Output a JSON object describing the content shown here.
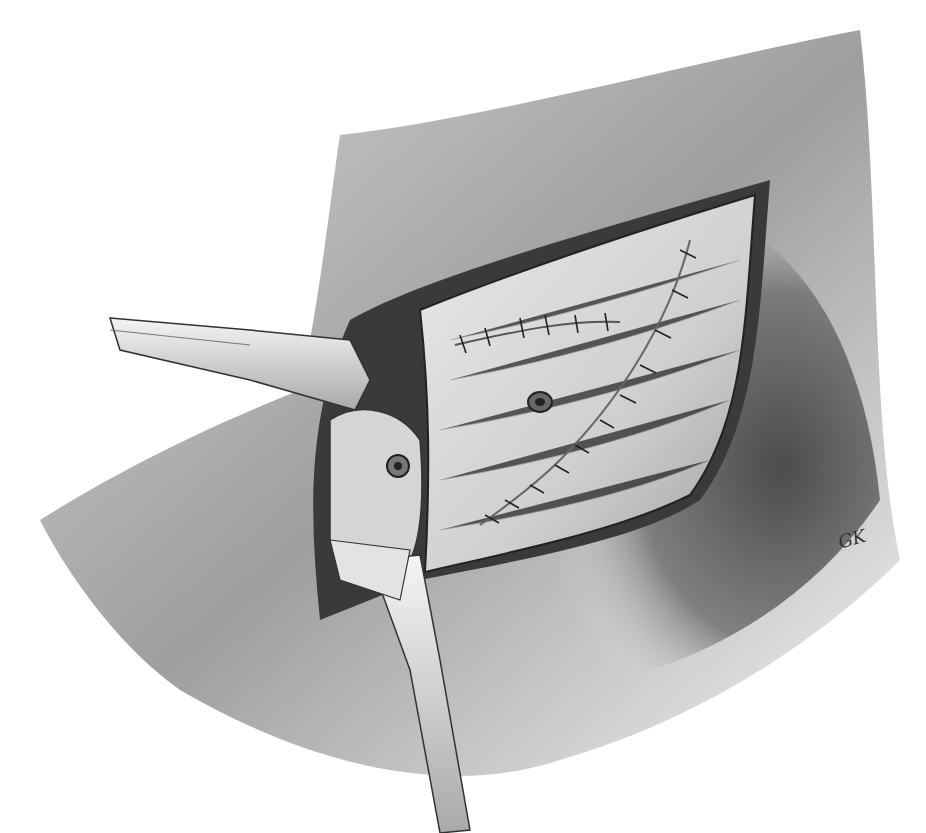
{
  "image": {
    "subject": "Pencil surgical illustration of an open incision with retractors and sutured tissue layers",
    "palette": {
      "background": "#ffffff",
      "skin_light": "#e8e8e8",
      "skin_mid": "#9a9a9a",
      "skin_dark": "#3c3c3c",
      "tissue": "#d9d9d9",
      "wound_edge": "#2a2a2a",
      "instrument": "#dcdcdc"
    },
    "signature": "GK",
    "suture_rows": 2,
    "ports": 2,
    "retractors": 2
  }
}
